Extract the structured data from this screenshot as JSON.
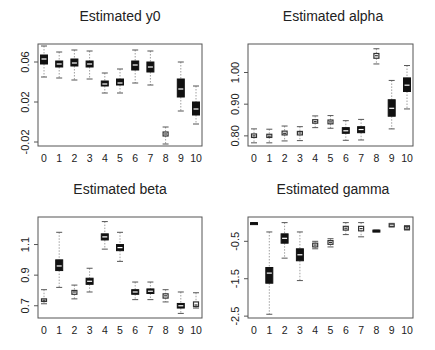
{
  "chart_data": [
    {
      "type": "box",
      "title": "Estimated y0",
      "xlabel": "",
      "ylabel": "",
      "categories": [
        "0",
        "1",
        "2",
        "3",
        "4",
        "5",
        "6",
        "7",
        "8",
        "9",
        "10"
      ],
      "yticks": [
        "0.06",
        "0.02",
        "-0.02"
      ],
      "ytick_values": [
        0.06,
        0.02,
        -0.02
      ],
      "ylim": [
        -0.024,
        0.078
      ],
      "boxes": [
        {
          "cat": "0",
          "min": 0.045,
          "q1": 0.058,
          "median": 0.063,
          "q3": 0.067,
          "max": 0.076
        },
        {
          "cat": "1",
          "min": 0.044,
          "q1": 0.055,
          "median": 0.058,
          "q3": 0.061,
          "max": 0.07
        },
        {
          "cat": "2",
          "min": 0.042,
          "q1": 0.056,
          "median": 0.059,
          "q3": 0.063,
          "max": 0.072
        },
        {
          "cat": "3",
          "min": 0.043,
          "q1": 0.055,
          "median": 0.058,
          "q3": 0.061,
          "max": 0.071
        },
        {
          "cat": "4",
          "min": 0.029,
          "q1": 0.036,
          "median": 0.038,
          "q3": 0.041,
          "max": 0.049
        },
        {
          "cat": "5",
          "min": 0.029,
          "q1": 0.037,
          "median": 0.039,
          "q3": 0.043,
          "max": 0.053
        },
        {
          "cat": "6",
          "min": 0.039,
          "q1": 0.052,
          "median": 0.057,
          "q3": 0.061,
          "max": 0.072
        },
        {
          "cat": "7",
          "min": 0.037,
          "q1": 0.05,
          "median": 0.055,
          "q3": 0.06,
          "max": 0.071
        },
        {
          "cat": "8",
          "min": -0.022,
          "q1": -0.014,
          "median": -0.012,
          "q3": -0.01,
          "max": -0.005
        },
        {
          "cat": "9",
          "min": 0.011,
          "q1": 0.025,
          "median": 0.033,
          "q3": 0.043,
          "max": 0.06
        },
        {
          "cat": "10",
          "min": -0.002,
          "q1": 0.007,
          "median": 0.013,
          "q3": 0.02,
          "max": 0.036
        }
      ]
    },
    {
      "type": "box",
      "title": "Estimated alpha",
      "xlabel": "",
      "ylabel": "",
      "categories": [
        "0",
        "1",
        "2",
        "3",
        "4",
        "5",
        "6",
        "7",
        "8",
        "9",
        "10"
      ],
      "yticks": [
        "1.00",
        "0.90",
        "0.80"
      ],
      "ytick_values": [
        1.0,
        0.9,
        0.8
      ],
      "ylim": [
        0.768,
        1.09
      ],
      "boxes": [
        {
          "cat": "0",
          "min": 0.778,
          "q1": 0.795,
          "median": 0.8,
          "q3": 0.806,
          "max": 0.822
        },
        {
          "cat": "1",
          "min": 0.778,
          "q1": 0.795,
          "median": 0.799,
          "q3": 0.805,
          "max": 0.821
        },
        {
          "cat": "2",
          "min": 0.784,
          "q1": 0.803,
          "median": 0.808,
          "q3": 0.815,
          "max": 0.831
        },
        {
          "cat": "3",
          "min": 0.785,
          "q1": 0.803,
          "median": 0.809,
          "q3": 0.814,
          "max": 0.829
        },
        {
          "cat": "4",
          "min": 0.826,
          "q1": 0.84,
          "median": 0.845,
          "q3": 0.851,
          "max": 0.863
        },
        {
          "cat": "5",
          "min": 0.824,
          "q1": 0.838,
          "median": 0.844,
          "q3": 0.85,
          "max": 0.864
        },
        {
          "cat": "6",
          "min": 0.786,
          "q1": 0.808,
          "median": 0.816,
          "q3": 0.826,
          "max": 0.848
        },
        {
          "cat": "7",
          "min": 0.787,
          "q1": 0.81,
          "median": 0.82,
          "q3": 0.829,
          "max": 0.852
        },
        {
          "cat": "8",
          "min": 1.027,
          "q1": 1.045,
          "median": 1.053,
          "q3": 1.06,
          "max": 1.075
        },
        {
          "cat": "9",
          "min": 0.822,
          "q1": 0.862,
          "median": 0.887,
          "q3": 0.914,
          "max": 0.975
        },
        {
          "cat": "10",
          "min": 0.885,
          "q1": 0.94,
          "median": 0.96,
          "q3": 0.983,
          "max": 1.022
        }
      ]
    },
    {
      "type": "box",
      "title": "Estimated beta",
      "xlabel": "",
      "ylabel": "",
      "categories": [
        "0",
        "1",
        "2",
        "3",
        "4",
        "5",
        "6",
        "7",
        "8",
        "9",
        "10"
      ],
      "yticks": [
        "1.1",
        "0.9",
        "0.7"
      ],
      "ytick_values": [
        1.1,
        0.9,
        0.7
      ],
      "ylim": [
        0.62,
        1.28
      ],
      "boxes": [
        {
          "cat": "0",
          "min": 0.713,
          "q1": 0.728,
          "median": 0.736,
          "q3": 0.745,
          "max": 0.805
        },
        {
          "cat": "1",
          "min": 0.82,
          "q1": 0.93,
          "median": 0.96,
          "q3": 1.0,
          "max": 1.18
        },
        {
          "cat": "2",
          "min": 0.745,
          "q1": 0.775,
          "median": 0.79,
          "q3": 0.8,
          "max": 0.835
        },
        {
          "cat": "3",
          "min": 0.79,
          "q1": 0.84,
          "median": 0.86,
          "q3": 0.88,
          "max": 0.945
        },
        {
          "cat": "4",
          "min": 1.07,
          "q1": 1.13,
          "median": 1.15,
          "q3": 1.17,
          "max": 1.25
        },
        {
          "cat": "5",
          "min": 0.99,
          "q1": 1.06,
          "median": 1.08,
          "q3": 1.1,
          "max": 1.18
        },
        {
          "cat": "6",
          "min": 0.74,
          "q1": 0.775,
          "median": 0.79,
          "q3": 0.805,
          "max": 0.855
        },
        {
          "cat": "7",
          "min": 0.74,
          "q1": 0.78,
          "median": 0.795,
          "q3": 0.81,
          "max": 0.855
        },
        {
          "cat": "8",
          "min": 0.725,
          "q1": 0.75,
          "median": 0.765,
          "q3": 0.778,
          "max": 0.805
        },
        {
          "cat": "9",
          "min": 0.65,
          "q1": 0.685,
          "median": 0.7,
          "q3": 0.715,
          "max": 0.79
        },
        {
          "cat": "10",
          "min": 0.685,
          "q1": 0.695,
          "median": 0.705,
          "q3": 0.725,
          "max": 0.785
        }
      ]
    },
    {
      "type": "box",
      "title": "Estimated gamma",
      "xlabel": "",
      "ylabel": "",
      "categories": [
        "0",
        "1",
        "2",
        "3",
        "4",
        "5",
        "6",
        "7",
        "8",
        "9",
        "10"
      ],
      "yticks": [
        "-0.5",
        "-1.5",
        "-2.5"
      ],
      "ytick_values": [
        -0.5,
        -1.5,
        -2.5
      ],
      "ylim": [
        -2.55,
        0.15
      ],
      "boxes": [
        {
          "cat": "0",
          "min": 0.0,
          "q1": 0.0,
          "median": 0.0,
          "q3": 0.0,
          "max": 0.0
        },
        {
          "cat": "1",
          "min": -2.45,
          "q1": -1.62,
          "median": -1.35,
          "q3": -1.2,
          "max": -0.25
        },
        {
          "cat": "2",
          "min": -0.95,
          "q1": -0.55,
          "median": -0.42,
          "q3": -0.3,
          "max": 0.0
        },
        {
          "cat": "3",
          "min": -1.55,
          "q1": -1.02,
          "median": -0.86,
          "q3": -0.7,
          "max": -0.25
        },
        {
          "cat": "4",
          "min": -0.7,
          "q1": -0.65,
          "median": -0.6,
          "q3": -0.55,
          "max": -0.5
        },
        {
          "cat": "5",
          "min": -0.65,
          "q1": -0.58,
          "median": -0.53,
          "q3": -0.48,
          "max": -0.43
        },
        {
          "cat": "6",
          "min": -0.32,
          "q1": -0.2,
          "median": -0.15,
          "q3": -0.1,
          "max": 0.0
        },
        {
          "cat": "7",
          "min": -0.38,
          "q1": -0.22,
          "median": -0.16,
          "q3": -0.1,
          "max": 0.0
        },
        {
          "cat": "8",
          "min": -0.24,
          "q1": -0.24,
          "median": -0.22,
          "q3": -0.2,
          "max": -0.2
        },
        {
          "cat": "9",
          "min": -0.12,
          "q1": -0.1,
          "median": -0.07,
          "q3": -0.04,
          "max": -0.02
        },
        {
          "cat": "10",
          "min": -0.2,
          "q1": -0.18,
          "median": -0.14,
          "q3": -0.1,
          "max": -0.08
        }
      ]
    }
  ],
  "panels": [
    {
      "title": "Estimated y0"
    },
    {
      "title": "Estimated alpha"
    },
    {
      "title": "Estimated beta"
    },
    {
      "title": "Estimated gamma"
    }
  ]
}
